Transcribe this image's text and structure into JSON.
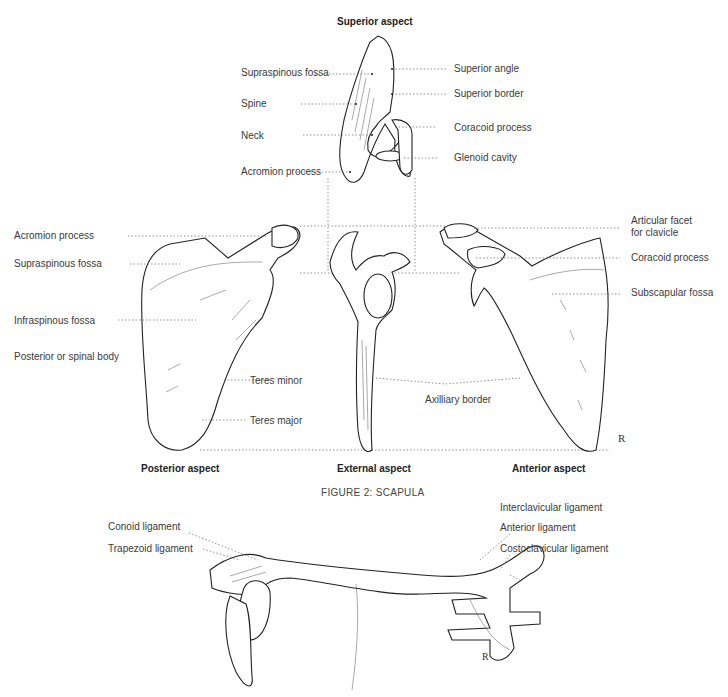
{
  "figure": {
    "caption": "FIGURE 2: SCAPULA",
    "views": {
      "superior": "Superior aspect",
      "posterior": "Posterior aspect",
      "external": "External aspect",
      "anterior": "Anterior aspect"
    }
  },
  "superior_labels": {
    "left": [
      "Supraspinous fossa",
      "Spine",
      "Neck",
      "Acromion process"
    ],
    "right": [
      "Superior angle",
      "Superior border",
      "Coracoid process",
      "Glenoid cavity"
    ]
  },
  "posterior_labels": {
    "left": [
      "Acromion process",
      "Supraspinous fossa",
      "Infraspinous fossa",
      "Posterior or spinal body"
    ],
    "right": [
      "Teres minor",
      "Teres major"
    ]
  },
  "external_labels": [
    "Axilliary border"
  ],
  "anterior_labels": [
    "Articular facet",
    "for clavicle",
    "Coracoid process",
    "Subscapular fossa"
  ],
  "clavicle_labels": {
    "left": [
      "Conoid ligament",
      "Trapezoid ligament"
    ],
    "right": [
      "Interclavicular ligament",
      "Anterior ligament",
      "Costoclavicular ligament"
    ]
  },
  "signature": "R"
}
